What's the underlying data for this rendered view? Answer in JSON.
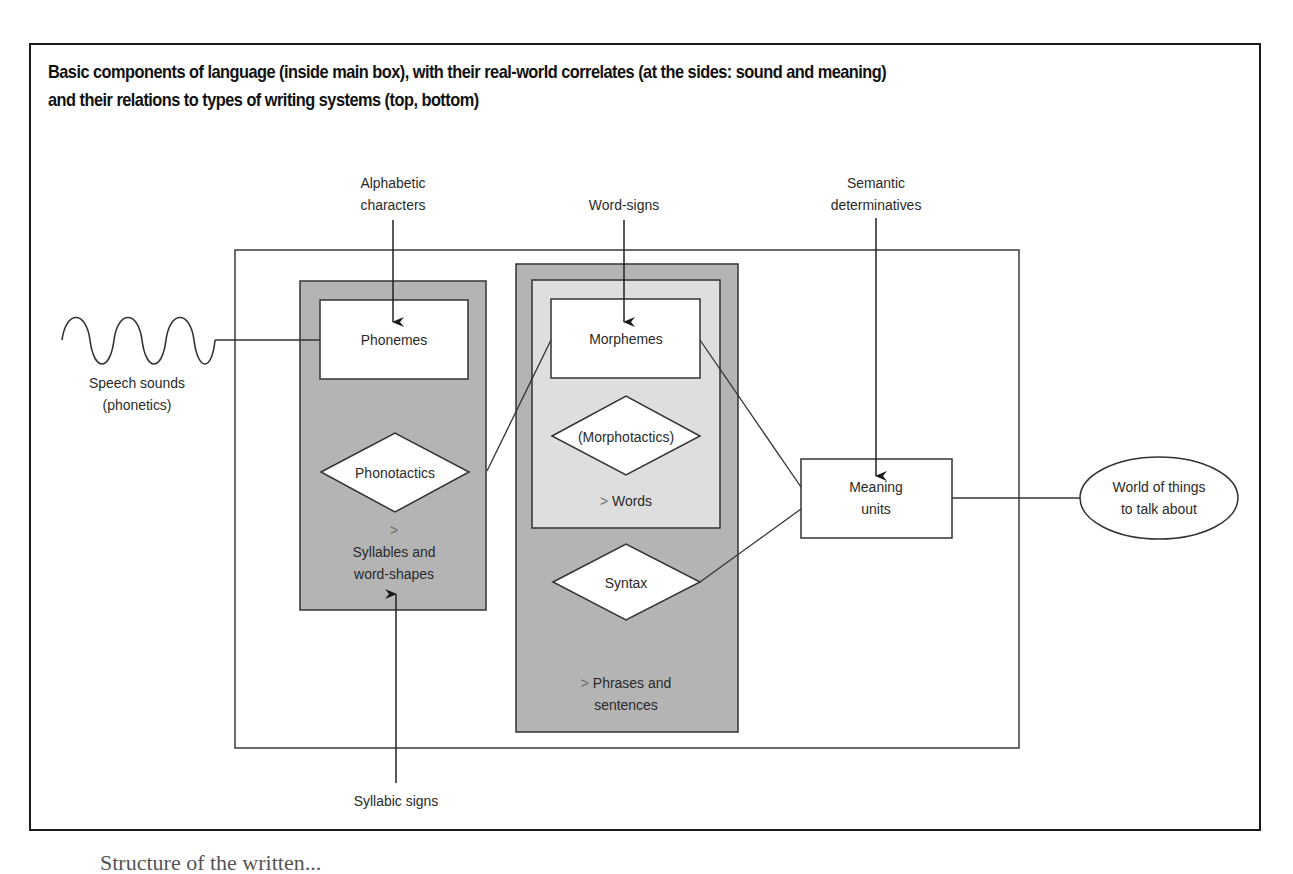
{
  "figure": {
    "title_line1": "Basic components of language (inside main box), with their real-world correlates (at the sides: sound and meaning)",
    "title_line2": "and their relations to types of writing systems (top, bottom)"
  },
  "correlates": {
    "sound": {
      "line1": "Speech sounds",
      "line2": "(phonetics)",
      "icon": "sound-wave-icon"
    },
    "meaning": {
      "line1": "World of things",
      "line2": "to talk about"
    }
  },
  "writing_systems": {
    "alphabetic": {
      "line1": "Alphabetic",
      "line2": "characters"
    },
    "word_signs": {
      "label": "Word-signs"
    },
    "semantic": {
      "line1": "Semantic",
      "line2": "determinatives"
    },
    "syllabic": {
      "label": "Syllabic signs"
    }
  },
  "components": {
    "phonemes": "Phonemes",
    "phonotactics": "Phonotactics",
    "syllables": {
      "arrow": ">",
      "line1": "Syllables and",
      "line2": "word-shapes"
    },
    "morphemes": "Morphemes",
    "morphotactics": "(Morphotactics)",
    "words": {
      "arrow": ">",
      "label": "Words"
    },
    "syntax": "Syntax",
    "phrases": {
      "arrow": ">",
      "line1": "Phrases and",
      "line2": "sentences"
    },
    "meaning_units": {
      "line1": "Meaning",
      "line2": "units"
    }
  },
  "colors": {
    "dark_panel": "#b4b4b4",
    "light_panel": "#dedede",
    "line": "#3a3a3a",
    "frame": "#1a1a1a"
  },
  "caption": "Structure of the written..."
}
